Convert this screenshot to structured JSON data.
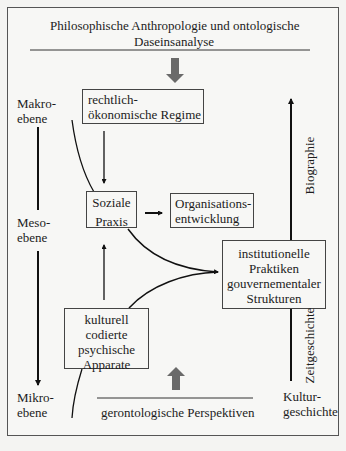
{
  "diagram": {
    "title_line1": "Philosophische Anthropologie und ontologische",
    "title_line2": "Daseinsanalyse",
    "bottom_label": "gerontologische Perspektiven",
    "levels": {
      "makro_line1": "Makro-",
      "makro_line2": "ebene",
      "meso_line1": "Meso-",
      "meso_line2": "ebene",
      "mikro_line1": "Mikro-",
      "mikro_line2": "ebene"
    },
    "boxes": {
      "regime_line1": "rechtlich-",
      "regime_line2": "ökonomische Regime",
      "praxis_line1": "Soziale",
      "praxis_line2": "Praxis",
      "org_line1": "Organisations-",
      "org_line2": "entwicklung",
      "inst_line1": "institutionelle",
      "inst_line2": "Praktiken",
      "inst_line3": "gouvernementaler",
      "inst_line4": "Strukturen",
      "kult_line1": "kulturell",
      "kult_line2": "codierte",
      "kult_line3": "psychische",
      "kult_line4": "Apparate"
    },
    "axis_right": {
      "biographie": "Biographie",
      "zeitgeschichte": "Zeitgeschichte",
      "kultur_line1": "Kultur-",
      "kultur_line2": "geschichte"
    },
    "colors": {
      "line": "#111111",
      "block_arrow": "#6a6a6a",
      "frame": "#555555",
      "background": "#f7f7f5"
    }
  }
}
